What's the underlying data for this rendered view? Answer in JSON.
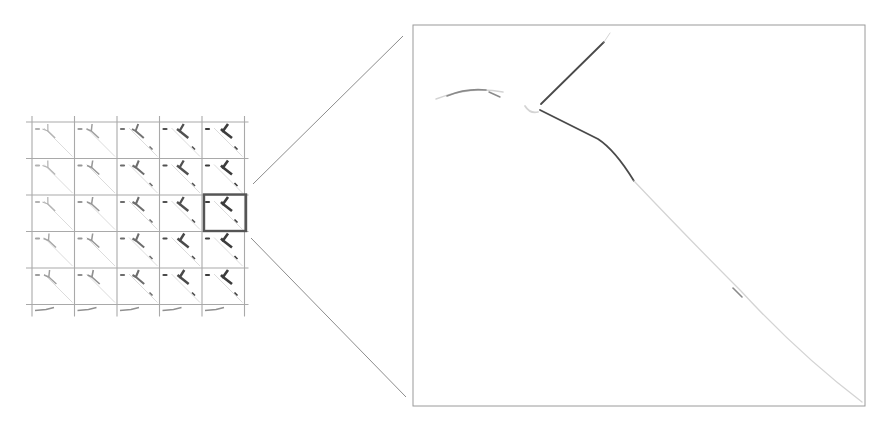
{
  "figure": {
    "colors": {
      "background": "#ffffff",
      "grid_line": "#a9a9a9",
      "highlight_box": "#555555",
      "connector": "#8c8c8c",
      "zoom_frame": "#9a9a9a",
      "edge_dark": "#4a4a4a",
      "edge_mid": "#8a8a8a",
      "edge_faint": "#d4d4d4"
    },
    "grid": {
      "columns": 5,
      "visible_rows": 6,
      "full_rows": 5,
      "partial_bottom_row": true,
      "origin_x": 32,
      "origin_y": 122,
      "cell_width": 42.5,
      "cell_height": 36.5,
      "highlighted_cell": {
        "row": 2,
        "col": 4
      }
    },
    "tile_strength": [
      [
        0.15,
        0.3,
        0.6,
        0.85,
        1.0
      ],
      [
        0.15,
        0.35,
        0.65,
        0.85,
        1.0
      ],
      [
        0.15,
        0.35,
        0.65,
        0.85,
        1.0
      ],
      [
        0.25,
        0.35,
        0.65,
        0.9,
        1.0
      ],
      [
        0.3,
        0.4,
        0.65,
        0.9,
        1.0
      ]
    ],
    "zoom_panel": {
      "x": 413,
      "y": 25,
      "width": 452,
      "height": 381
    }
  }
}
